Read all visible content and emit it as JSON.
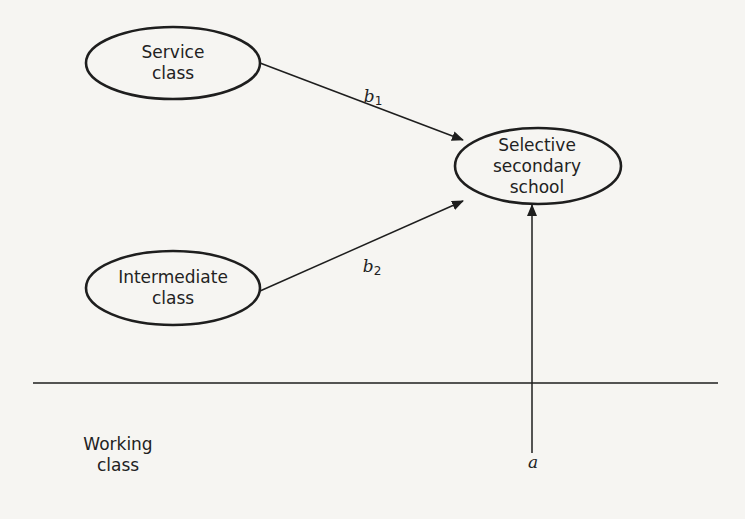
{
  "diagram": {
    "nodes": [
      {
        "id": "service",
        "line1": "Service",
        "line2": "class",
        "line3": ""
      },
      {
        "id": "intermediate",
        "line1": "Intermediate",
        "line2": "class",
        "line3": ""
      },
      {
        "id": "selective",
        "line1": "Selective",
        "line2": "secondary",
        "line3": "school"
      }
    ],
    "baseline_label": {
      "line1": "Working",
      "line2": "class"
    },
    "edges": [
      {
        "from": "service",
        "to": "selective",
        "label": "b",
        "subscript": "1"
      },
      {
        "from": "intermediate",
        "to": "selective",
        "label": "b",
        "subscript": "2"
      },
      {
        "from": "baseline",
        "to": "selective",
        "label": "a",
        "subscript": ""
      }
    ],
    "colors": {
      "background": "#f6f5f2",
      "stroke": "#1e1e1e",
      "text": "#222222"
    }
  }
}
